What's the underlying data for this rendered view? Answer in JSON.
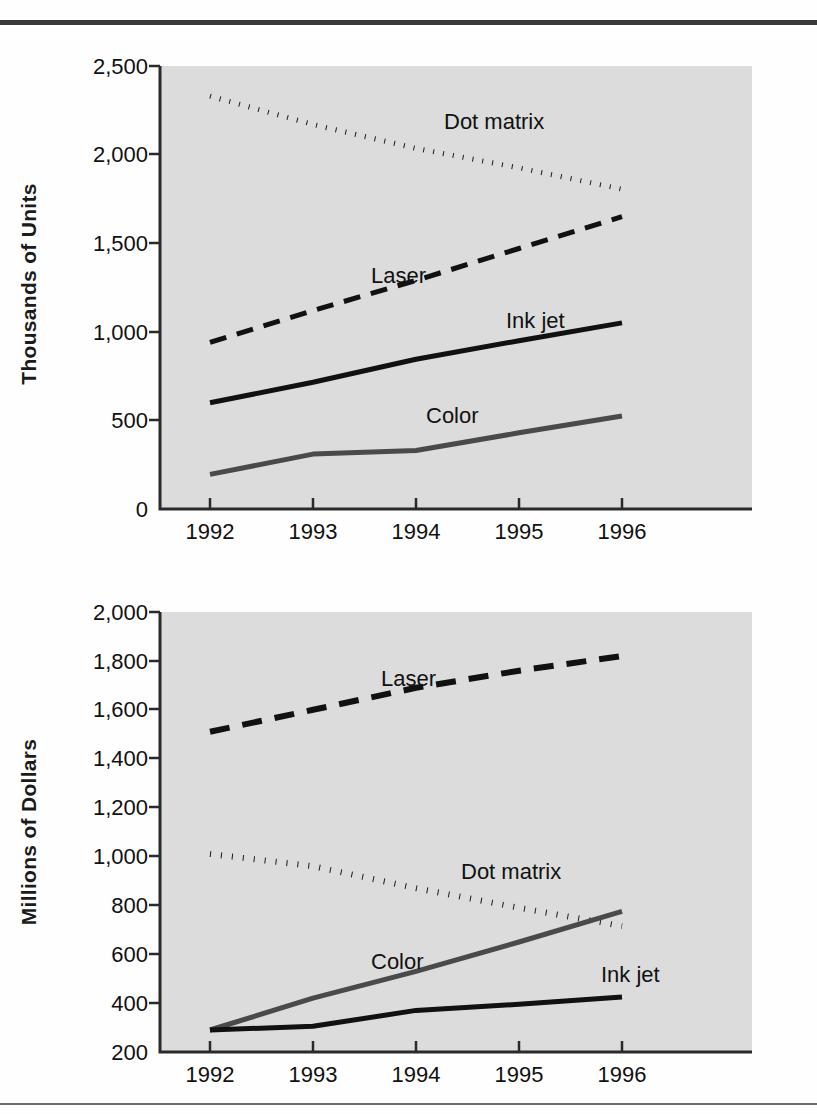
{
  "page": {
    "background_color": "#fefefe",
    "rule_color_top": "#3a3a3a",
    "rule_color_bottom": "#6b6b6b"
  },
  "charts": [
    {
      "id": "units",
      "ylabel": "Thousands of Units",
      "series_label_dot_matrix": "Dot matrix",
      "series_label_laser": "Laser",
      "series_label_ink_jet": "Ink jet",
      "series_label_color": "Color"
    },
    {
      "id": "dollars",
      "ylabel": "Millions of Dollars",
      "series_label_laser": "Laser",
      "series_label_dot_matrix": "Dot matrix",
      "series_label_color": "Color",
      "series_label_ink_jet": "Ink jet"
    }
  ],
  "chart_data": [
    {
      "type": "line",
      "id": "units",
      "title": "",
      "xlabel": "",
      "ylabel": "Thousands of Units",
      "x": [
        1992,
        1993,
        1994,
        1995,
        1996
      ],
      "categories": [
        "1992",
        "1993",
        "1994",
        "1995",
        "1996"
      ],
      "xtick_labels": [
        "1992",
        "1993",
        "1994",
        "1995",
        "1996"
      ],
      "ytick_labels": [
        "0",
        "500",
        "1,000",
        "1,500",
        "2,000",
        "2,500"
      ],
      "yticks": [
        0,
        500,
        1000,
        1500,
        2000,
        2500
      ],
      "ylim": [
        0,
        2500
      ],
      "xlim": [
        1992,
        1996
      ],
      "grid": false,
      "legend": "inline-labels",
      "plot_background": "#dcdcdc",
      "series": [
        {
          "name": "Dot matrix",
          "style": "dotted",
          "color": "#1a1a1a",
          "values": [
            2330,
            2170,
            2035,
            1925,
            1805
          ]
        },
        {
          "name": "Laser",
          "style": "dashed",
          "color": "#111111",
          "values": [
            940,
            1120,
            1290,
            1470,
            1650
          ]
        },
        {
          "name": "Ink jet",
          "style": "solid",
          "color": "#111111",
          "values": [
            600,
            715,
            845,
            950,
            1050
          ]
        },
        {
          "name": "Color",
          "style": "solid",
          "color": "#4a4a4a",
          "values": [
            195,
            310,
            330,
            430,
            525
          ]
        }
      ]
    },
    {
      "type": "line",
      "id": "dollars",
      "title": "",
      "xlabel": "",
      "ylabel": "Millions of Dollars",
      "x": [
        1992,
        1993,
        1994,
        1995,
        1996
      ],
      "categories": [
        "1992",
        "1993",
        "1994",
        "1995",
        "1996"
      ],
      "xtick_labels": [
        "1992",
        "1993",
        "1994",
        "1995",
        "1996"
      ],
      "ytick_labels": [
        "200",
        "400",
        "600",
        "800",
        "1,000",
        "1,200",
        "1,400",
        "1,600",
        "1,800",
        "2,000"
      ],
      "yticks": [
        200,
        400,
        600,
        800,
        1000,
        1200,
        1400,
        1600,
        1800,
        2000
      ],
      "ylim": [
        200,
        2000
      ],
      "xlim": [
        1992,
        1996
      ],
      "grid": false,
      "legend": "inline-labels",
      "plot_background": "#dcdcdc",
      "series": [
        {
          "name": "Laser",
          "style": "dashed",
          "color": "#111111",
          "values": [
            1510,
            1600,
            1690,
            1760,
            1820
          ]
        },
        {
          "name": "Dot matrix",
          "style": "dotted",
          "color": "#1a1a1a",
          "values": [
            1010,
            960,
            870,
            790,
            715
          ]
        },
        {
          "name": "Color",
          "style": "solid",
          "color": "#4a4a4a",
          "values": [
            290,
            420,
            530,
            650,
            775
          ]
        },
        {
          "name": "Ink jet",
          "style": "solid",
          "color": "#111111",
          "values": [
            290,
            305,
            370,
            395,
            425
          ]
        }
      ]
    }
  ]
}
